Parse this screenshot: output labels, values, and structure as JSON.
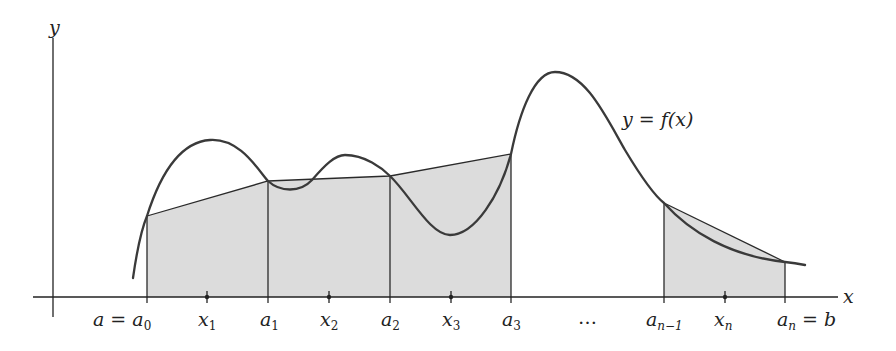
{
  "figure": {
    "colors": {
      "axis": "#222222",
      "curve": "#3a3a3a",
      "fill": "#dcdcdc",
      "background": "#ffffff"
    },
    "axes": {
      "x_label": "x",
      "y_label": "y"
    },
    "curve_label": "y = f(x)",
    "ellipsis": "…",
    "partition_labels": [
      {
        "id": "a0",
        "main": "a = a",
        "sub": "0"
      },
      {
        "id": "a1",
        "main": "a",
        "sub": "1"
      },
      {
        "id": "a2",
        "main": "a",
        "sub": "2"
      },
      {
        "id": "a3",
        "main": "a",
        "sub": "3"
      },
      {
        "id": "an-1",
        "main": "a",
        "sub": "n−1"
      },
      {
        "id": "an",
        "main": "a",
        "sub": "n",
        "suffix": " = b"
      }
    ],
    "sample_labels": [
      {
        "id": "x1",
        "main": "x",
        "sub": "1"
      },
      {
        "id": "x2",
        "main": "x",
        "sub": "2"
      },
      {
        "id": "x3",
        "main": "x",
        "sub": "3"
      },
      {
        "id": "xn",
        "main": "x",
        "sub": "n"
      }
    ],
    "trapezoids": [
      {
        "from": "a0",
        "to": "a1"
      },
      {
        "from": "a1",
        "to": "a2"
      },
      {
        "from": "a2",
        "to": "a3"
      },
      {
        "from": "an-1",
        "to": "an"
      }
    ]
  }
}
